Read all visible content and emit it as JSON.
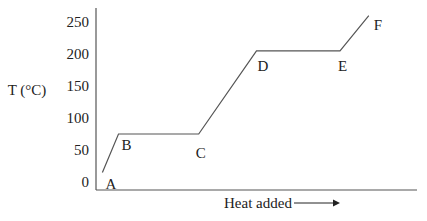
{
  "chart_data": {
    "type": "line",
    "title": "",
    "xlabel": "Heat added",
    "ylabel": "T (°C)",
    "ylim": [
      0,
      250
    ],
    "xlim": [
      0,
      100
    ],
    "yticks": [
      0,
      50,
      100,
      150,
      200,
      250
    ],
    "ytick_labels": [
      "0",
      "50",
      "100",
      "150",
      "200",
      "250"
    ],
    "xticks": [],
    "grid": false,
    "legend": "none",
    "xlabel_arrow": true,
    "series": [
      {
        "name": "heating curve",
        "x": [
          2,
          7,
          32,
          50,
          76,
          85
        ],
        "y": [
          15,
          75,
          75,
          205,
          205,
          260
        ]
      }
    ],
    "annotations": [
      {
        "label": "A",
        "x": 2,
        "y": 15
      },
      {
        "label": "B",
        "x": 7,
        "y": 75
      },
      {
        "label": "C",
        "x": 32,
        "y": 75
      },
      {
        "label": "D",
        "x": 50,
        "y": 205
      },
      {
        "label": "E",
        "x": 76,
        "y": 205
      },
      {
        "label": "F",
        "x": 85,
        "y": 260
      }
    ],
    "colors": {
      "line": "#555555",
      "text": "#222222"
    }
  }
}
